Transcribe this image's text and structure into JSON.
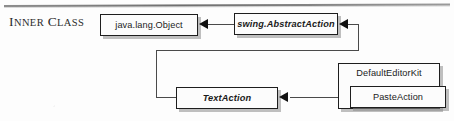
{
  "page": {
    "section_label": "Inner Class",
    "section_label_parts": {
      "word1_cap": "I",
      "word1_rest": "nner",
      "word2_cap": "C",
      "word2_rest": "lass"
    },
    "background_color": "#fdfdfd",
    "rule_color": "#6f6f6f"
  },
  "diagram": {
    "type": "uml-class-diagram",
    "line_color": "#4a4a4a",
    "box_border_color": "#1e1e1e",
    "box_fill_color": "#fcfcfc",
    "shadow_color": "#8c8c8c",
    "arrowhead_color": "#111111",
    "classes": [
      {
        "id": "object",
        "name": "java.lang.Object",
        "abstract": false
      },
      {
        "id": "abstract_action",
        "name": "swing.AbstractAction",
        "abstract": true
      },
      {
        "id": "text_action",
        "name": "TextAction",
        "abstract": true
      },
      {
        "id": "default_editor_kit",
        "name": "DefaultEditorKit",
        "abstract": false
      },
      {
        "id": "paste_action",
        "name": "PasteAction",
        "abstract": false
      }
    ],
    "relationships": [
      {
        "from": "abstract_action",
        "to": "object",
        "kind": "generalization"
      },
      {
        "from": "text_action",
        "to": "abstract_action",
        "kind": "generalization"
      },
      {
        "from": "paste_action",
        "to": "text_action",
        "kind": "generalization"
      },
      {
        "from": "paste_action",
        "to": "default_editor_kit",
        "kind": "nested-inner-class"
      }
    ]
  }
}
